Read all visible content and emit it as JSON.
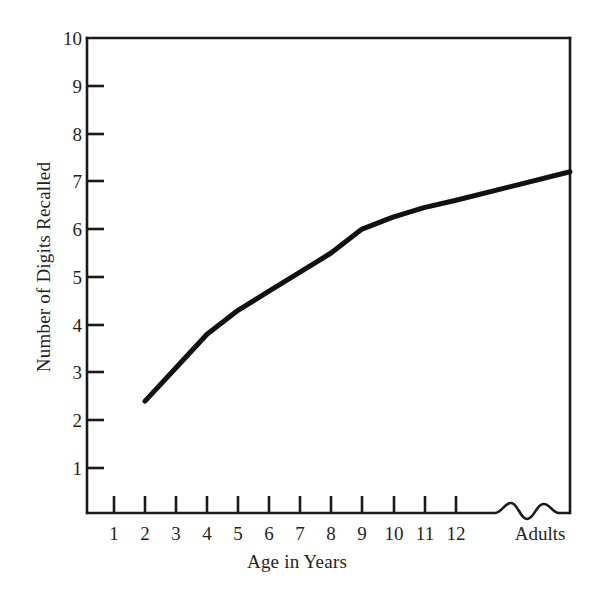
{
  "chart_data": {
    "type": "line",
    "title": "",
    "xlabel": "Age in Years",
    "ylabel": "Number of Digits Recalled",
    "x_tick_labels": [
      "1",
      "2",
      "3",
      "4",
      "5",
      "6",
      "7",
      "8",
      "9",
      "10",
      "11",
      "12",
      "Adults"
    ],
    "y_tick_labels": [
      "1",
      "2",
      "3",
      "4",
      "5",
      "6",
      "7",
      "8",
      "9",
      "10"
    ],
    "ylim": [
      0,
      10
    ],
    "grid": false,
    "legend": null,
    "axis_break": {
      "present": true,
      "style": "wavy-squiggle",
      "location": "x-axis between 12 and Adults"
    },
    "series": [
      {
        "name": "Digit span",
        "categories": [
          "2",
          "3",
          "4",
          "5",
          "6",
          "7",
          "8",
          "9",
          "10",
          "11",
          "12",
          "Adults"
        ],
        "values": [
          2.4,
          3.1,
          3.8,
          4.3,
          4.7,
          5.1,
          5.5,
          6.0,
          6.25,
          6.45,
          6.6,
          7.2
        ]
      }
    ]
  },
  "axes": {
    "y_label": "Number of Digits Recalled",
    "x_label": "Age in Years",
    "y_ticks": [
      {
        "label": "10",
        "value": 10
      },
      {
        "label": "9",
        "value": 9
      },
      {
        "label": "8",
        "value": 8
      },
      {
        "label": "7",
        "value": 7
      },
      {
        "label": "6",
        "value": 6
      },
      {
        "label": "5",
        "value": 5
      },
      {
        "label": "4",
        "value": 4
      },
      {
        "label": "3",
        "value": 3
      },
      {
        "label": "2",
        "value": 2
      },
      {
        "label": "1",
        "value": 1
      }
    ],
    "x_ticks": [
      {
        "label": "1"
      },
      {
        "label": "2"
      },
      {
        "label": "3"
      },
      {
        "label": "4"
      },
      {
        "label": "5"
      },
      {
        "label": "6"
      },
      {
        "label": "7"
      },
      {
        "label": "8"
      },
      {
        "label": "9"
      },
      {
        "label": "10"
      },
      {
        "label": "11"
      },
      {
        "label": "12"
      },
      {
        "label": "Adults"
      }
    ]
  },
  "style": {
    "line_color": "#111111",
    "axis_color": "#1a1a1a",
    "text_color": "#1f1f1f",
    "background": "#ffffff"
  }
}
